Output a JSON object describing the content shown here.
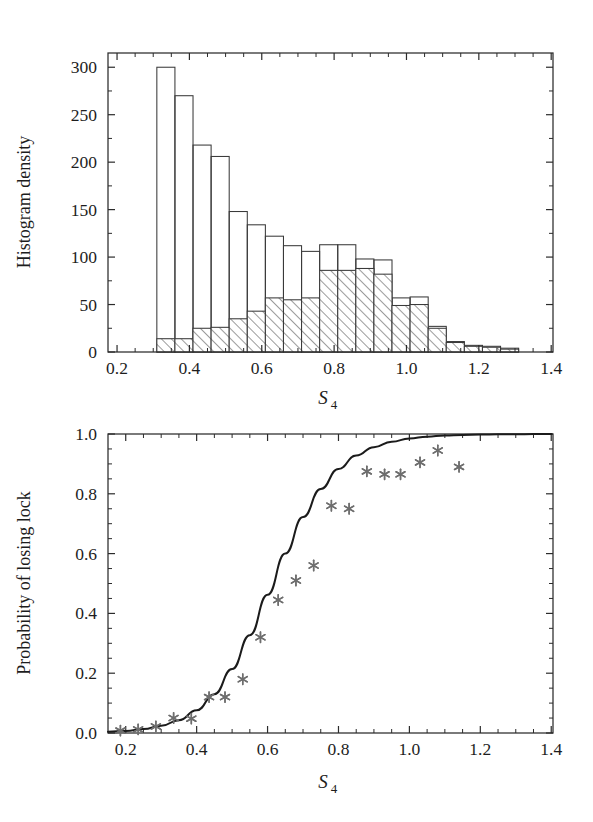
{
  "figure": {
    "background_color": "#ffffff",
    "ink_color": "#1d1d1d",
    "marker_color": "#6e6e6e",
    "curve_color": "#1b1b1b"
  },
  "chart_data": [
    {
      "type": "bar",
      "name": "histogram-s4-density",
      "title": "",
      "xlabel": "S4",
      "xlabel_base": "S",
      "xlabel_sub": "4",
      "ylabel": "Histogram density",
      "xlim": [
        0.175,
        1.405
      ],
      "ylim": [
        0,
        315
      ],
      "xticks": [
        0.2,
        0.4,
        0.6,
        0.8,
        1.0,
        1.2,
        1.4
      ],
      "xtick_labels": [
        "0.2",
        "0.4",
        "0.6",
        "0.8",
        "1.0",
        "1.2",
        "1.4"
      ],
      "x_minor_step": 0.05,
      "yticks": [
        0,
        50,
        100,
        150,
        200,
        250,
        300
      ],
      "ytick_labels": [
        "0",
        "50",
        "100",
        "150",
        "200",
        "250",
        "300"
      ],
      "y_minor_step": 25,
      "grid": false,
      "legend": "none",
      "bin_width": 0.05,
      "bin_edges": [
        0.31,
        0.36,
        0.41,
        0.46,
        0.51,
        0.56,
        0.61,
        0.66,
        0.71,
        0.76,
        0.81,
        0.86,
        0.91,
        0.96,
        1.01,
        1.06,
        1.11,
        1.16,
        1.21,
        1.26,
        1.31
      ],
      "series": [
        {
          "name": "Total (outline)",
          "style": "open",
          "values": [
            300,
            270,
            218,
            206,
            148,
            134,
            122,
            112,
            106,
            113,
            113,
            98,
            97,
            57,
            58,
            27,
            11,
            7,
            6,
            4
          ]
        },
        {
          "name": "Lock lost (hatched)",
          "style": "hatched",
          "values": [
            14,
            14,
            25,
            26,
            35,
            43,
            57,
            55,
            57,
            86,
            86,
            88,
            82,
            49,
            50,
            25,
            10,
            6,
            5,
            3
          ]
        }
      ]
    },
    {
      "type": "scatter",
      "name": "probability-of-losing-lock",
      "title": "",
      "xlabel": "S4",
      "xlabel_base": "S",
      "xlabel_sub": "4",
      "ylabel": "Probability of losing lock",
      "xlim": [
        0.15,
        1.405
      ],
      "ylim": [
        0.0,
        1.0
      ],
      "xticks": [
        0.2,
        0.4,
        0.6,
        0.8,
        1.0,
        1.2,
        1.4
      ],
      "xtick_labels": [
        "0.2",
        "0.4",
        "0.6",
        "0.8",
        "1.0",
        "1.2",
        "1.4"
      ],
      "x_minor_step": 0.05,
      "yticks": [
        0.0,
        0.2,
        0.4,
        0.6,
        0.8,
        1.0
      ],
      "ytick_labels": [
        "0.0",
        "0.2",
        "0.4",
        "0.6",
        "0.8",
        "1.0"
      ],
      "y_minor_step": 0.05,
      "grid": false,
      "legend": "none",
      "points": {
        "marker": "asterisk",
        "color": "#6e6e6e",
        "x": [
          0.185,
          0.235,
          0.285,
          0.335,
          0.385,
          0.435,
          0.48,
          0.53,
          0.58,
          0.63,
          0.68,
          0.73,
          0.78,
          0.83,
          0.88,
          0.93,
          0.975,
          1.03,
          1.08,
          1.14
        ],
        "y": [
          0.008,
          0.012,
          0.022,
          0.05,
          0.048,
          0.12,
          0.12,
          0.18,
          0.32,
          0.445,
          0.51,
          0.56,
          0.76,
          0.75,
          0.875,
          0.865,
          0.865,
          0.905,
          0.945,
          0.89
        ]
      },
      "fit_curve": {
        "name": "Logistic fit",
        "color": "#1b1b1b",
        "x": [
          0.15,
          0.2,
          0.25,
          0.3,
          0.35,
          0.4,
          0.45,
          0.5,
          0.55,
          0.6,
          0.65,
          0.7,
          0.75,
          0.8,
          0.85,
          0.9,
          0.95,
          1.0,
          1.05,
          1.1,
          1.15,
          1.2,
          1.25,
          1.3,
          1.35,
          1.4
        ],
        "y": [
          0.004,
          0.007,
          0.013,
          0.024,
          0.043,
          0.076,
          0.13,
          0.214,
          0.327,
          0.462,
          0.6,
          0.722,
          0.816,
          0.883,
          0.928,
          0.956,
          0.974,
          0.985,
          0.991,
          0.995,
          0.997,
          0.998,
          0.999,
          0.999,
          1.0,
          1.0
        ]
      }
    }
  ]
}
